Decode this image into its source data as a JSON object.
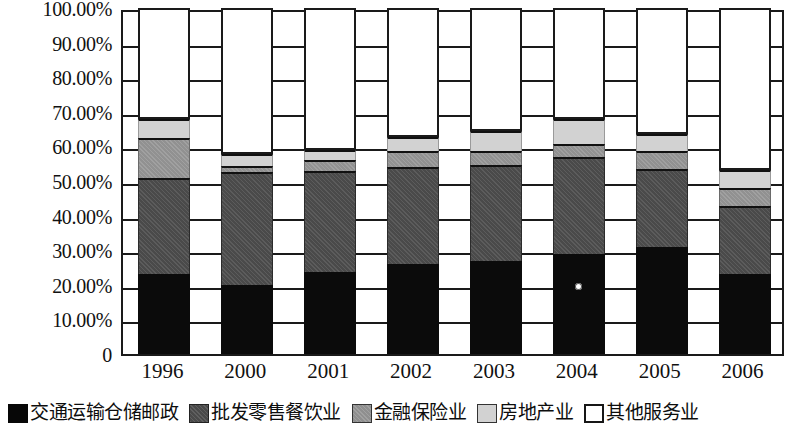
{
  "chart_data": {
    "type": "bar",
    "stacked": true,
    "stacked_normalized": true,
    "title": "",
    "subtitle": "",
    "xlabel": "",
    "ylabel": "",
    "grid": true,
    "legend_position": "bottom",
    "ylim": [
      0,
      100
    ],
    "ytick_labels": [
      "100.00%",
      "90.00%",
      "80.00%",
      "70.00%",
      "60.00%",
      "50.00%",
      "40.00%",
      "30.00%",
      "20.00%",
      "10.00%",
      "0"
    ],
    "ytick_values": [
      100,
      90,
      80,
      70,
      60,
      50,
      40,
      30,
      20,
      10,
      0
    ],
    "categories": [
      "1996",
      "2000",
      "2001",
      "2002",
      "2003",
      "2004",
      "2005",
      "2006"
    ],
    "series": [
      {
        "name": "交通运输仓储邮政",
        "color": "#0b0b0b",
        "values": [
          23.0,
          20.0,
          23.8,
          26.0,
          27.0,
          29.0,
          31.0,
          23.2
        ]
      },
      {
        "name": "批发零售餐饮业",
        "color": "#4a4a4a",
        "values": [
          28.0,
          32.5,
          29.0,
          28.0,
          27.5,
          28.0,
          22.5,
          19.5
        ]
      },
      {
        "name": "金融保险业",
        "color": "#919191",
        "values": [
          11.5,
          1.8,
          3.3,
          4.6,
          4.3,
          3.7,
          5.2,
          5.2
        ]
      },
      {
        "name": "房地产业",
        "color": "#d2d2d2",
        "values": [
          5.3,
          3.5,
          2.9,
          4.0,
          5.7,
          7.3,
          4.8,
          5.2
        ]
      },
      {
        "name": "其他服务业",
        "color": "#ffffff",
        "values": [
          32.2,
          42.2,
          41.0,
          37.4,
          35.5,
          32.0,
          36.5,
          46.9
        ]
      }
    ]
  },
  "legend": {
    "items": [
      {
        "label": "交通运输仓储邮政",
        "swatch": "black-filled-square"
      },
      {
        "label": "批发零售餐饮业",
        "swatch": "dark-gray-square"
      },
      {
        "label": "金融保险业",
        "swatch": "mid-gray-square"
      },
      {
        "label": "房地产业",
        "swatch": "light-gray-square"
      },
      {
        "label": "其他服务业",
        "swatch": "white-outlined-square"
      }
    ]
  }
}
